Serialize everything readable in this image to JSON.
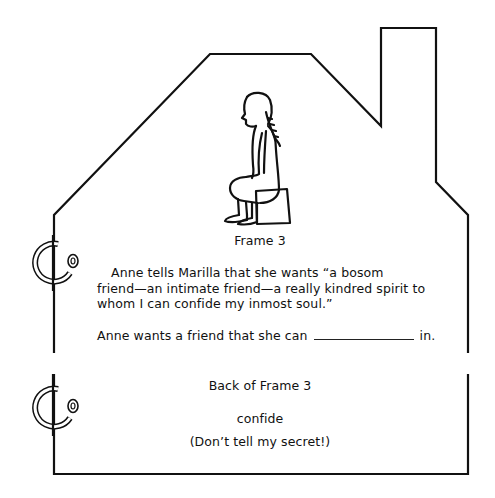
{
  "front": {
    "caption": "Frame 3",
    "paragraph_lines": [
      "Anne tells Marilla that she wants “a bosom",
      "friend—an intimate friend—a really kindred spirit to",
      "whom I can confide my inmost soul.”"
    ],
    "prompt_before": "Anne wants a friend that she can",
    "prompt_after": "in.",
    "illustration": "girl-seated-on-stool"
  },
  "back": {
    "title": "Back of Frame 3",
    "answer": "confide",
    "note": "(Don’t tell my secret!)"
  },
  "colors": {
    "line": "#111111",
    "background": "#ffffff"
  }
}
